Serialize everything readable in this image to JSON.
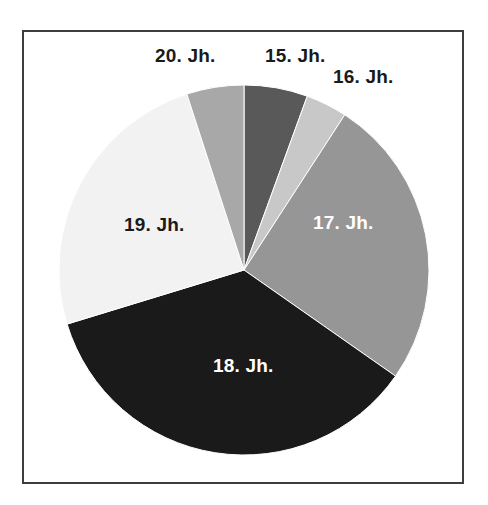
{
  "chart_data": {
    "type": "pie",
    "title": "",
    "subtitle": "",
    "xlabel": "",
    "ylabel": "",
    "legend_position": "none",
    "grid": false,
    "labels_inside_and_outside": true,
    "start_angle_deg": 0,
    "direction": "clockwise",
    "categories": [
      "15. Jh.",
      "16. Jh.",
      "17. Jh.",
      "18. Jh.",
      "19. Jh.",
      "20. Jh."
    ],
    "values": [
      5.6,
      3.6,
      25.6,
      35.6,
      24.7,
      5.0
    ],
    "angles_deg": [
      20,
      13,
      92,
      128,
      89,
      18
    ],
    "colors": [
      "#595959",
      "#c8c8c8",
      "#969696",
      "#1a1a1a",
      "#f2f2f2",
      "#a8a8a8"
    ],
    "slices": [
      {
        "label": "15. Jh.",
        "value": 5.6,
        "angle_deg": 20,
        "color": "#595959",
        "label_color": "#1a1a1a",
        "label_placement": "outside-top"
      },
      {
        "label": "16. Jh.",
        "value": 3.6,
        "angle_deg": 13,
        "color": "#c8c8c8",
        "label_color": "#1a1a1a",
        "label_placement": "outside-top-right"
      },
      {
        "label": "17. Jh.",
        "value": 25.6,
        "angle_deg": 92,
        "color": "#969696",
        "label_color": "#ffffff",
        "label_placement": "inside"
      },
      {
        "label": "18. Jh.",
        "value": 35.6,
        "angle_deg": 128,
        "color": "#1a1a1a",
        "label_color": "#ffffff",
        "label_placement": "inside"
      },
      {
        "label": "19. Jh.",
        "value": 24.7,
        "angle_deg": 89,
        "color": "#f2f2f2",
        "label_color": "#1a1a1a",
        "label_placement": "inside"
      },
      {
        "label": "20. Jh.",
        "value": 5.0,
        "angle_deg": 18,
        "color": "#a8a8a8",
        "label_color": "#1a1a1a",
        "label_placement": "outside-top-left"
      }
    ]
  },
  "chart": {
    "frame_border_color": "#3d3d3d",
    "background_color": "#ffffff",
    "center_x": 244,
    "center_y": 270,
    "radius": 185
  }
}
